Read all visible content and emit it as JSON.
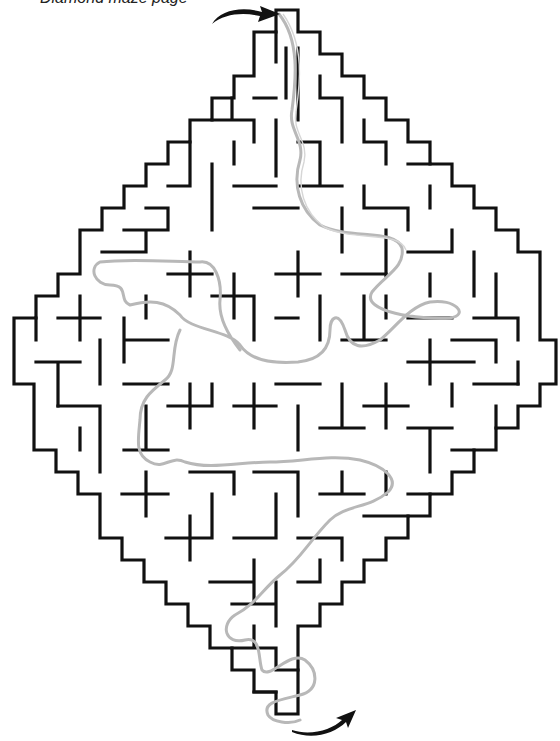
{
  "caption": {
    "text": "Diamond maze page"
  },
  "maze": {
    "shape": "diamond",
    "cell_size": 22,
    "wall_color": "#111111",
    "solution_color": "#b8b8b8",
    "entry": {
      "label": "start",
      "icon": "curved-arrow-right-icon",
      "x": 276,
      "y": 12
    },
    "exit": {
      "label": "finish",
      "icon": "curved-arrow-up-right-icon",
      "x": 300,
      "y": 722
    }
  }
}
